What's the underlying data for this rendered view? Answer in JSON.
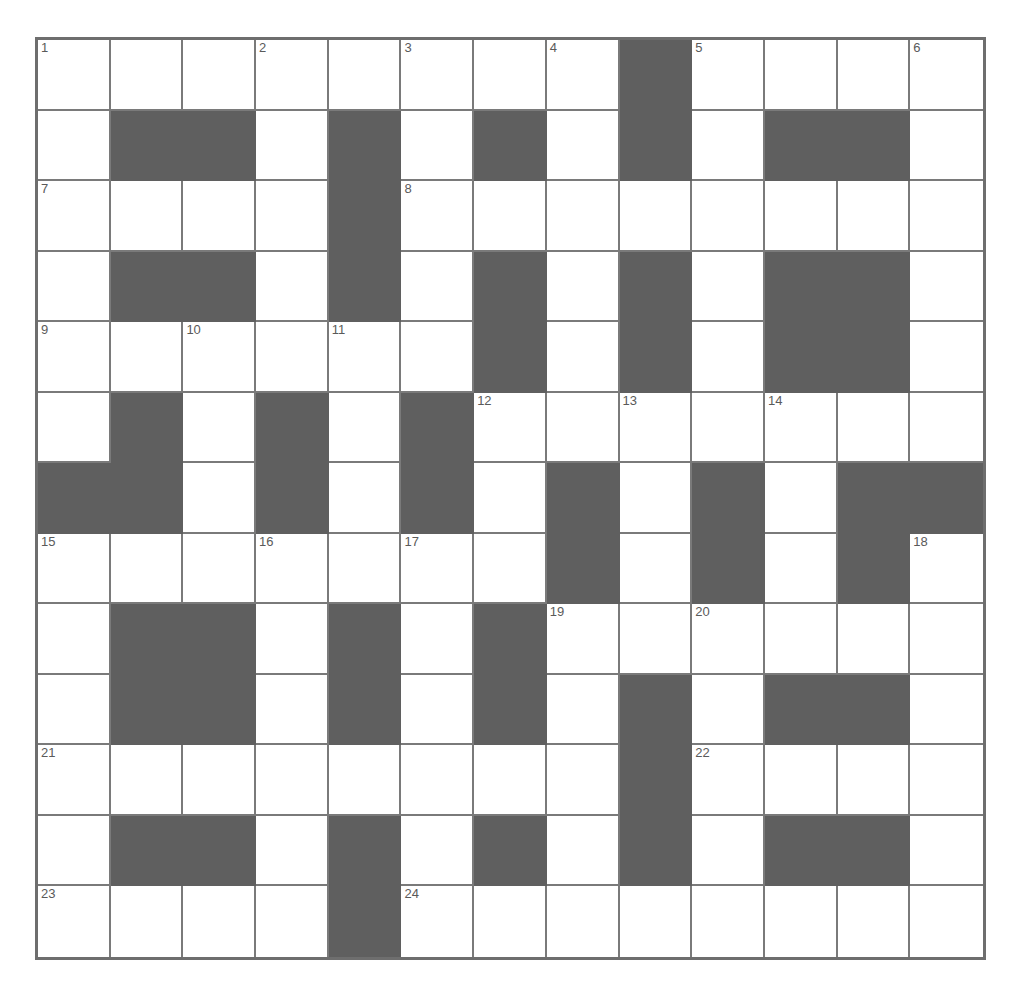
{
  "puzzle": {
    "rows": 13,
    "cols": 13,
    "colors": {
      "block": "#5f5f5f",
      "cell": "#ffffff",
      "grid_line": "#7a7a7a",
      "number": "#5a5a5a"
    },
    "grid": [
      "........#....",
      ".##.#.#.#.##.",
      "....#........",
      ".##.#.#.#.##.",
      "......#.#.##.",
      ".#.#.#.......",
      "##.#.#.#.#.##",
      ".......#.#.#.",
      ".##.#.#......",
      ".##.#.#.#.##.",
      "........#....",
      ".##.#.#.#.##.",
      "....#........"
    ],
    "numbers": [
      {
        "row": 0,
        "col": 0,
        "n": "1"
      },
      {
        "row": 0,
        "col": 3,
        "n": "2"
      },
      {
        "row": 0,
        "col": 5,
        "n": "3"
      },
      {
        "row": 0,
        "col": 7,
        "n": "4"
      },
      {
        "row": 0,
        "col": 9,
        "n": "5"
      },
      {
        "row": 0,
        "col": 12,
        "n": "6"
      },
      {
        "row": 2,
        "col": 0,
        "n": "7"
      },
      {
        "row": 2,
        "col": 5,
        "n": "8"
      },
      {
        "row": 4,
        "col": 0,
        "n": "9"
      },
      {
        "row": 4,
        "col": 2,
        "n": "10"
      },
      {
        "row": 4,
        "col": 4,
        "n": "11"
      },
      {
        "row": 5,
        "col": 6,
        "n": "12"
      },
      {
        "row": 5,
        "col": 8,
        "n": "13"
      },
      {
        "row": 5,
        "col": 10,
        "n": "14"
      },
      {
        "row": 7,
        "col": 0,
        "n": "15"
      },
      {
        "row": 7,
        "col": 3,
        "n": "16"
      },
      {
        "row": 7,
        "col": 5,
        "n": "17"
      },
      {
        "row": 7,
        "col": 12,
        "n": "18"
      },
      {
        "row": 8,
        "col": 7,
        "n": "19"
      },
      {
        "row": 8,
        "col": 9,
        "n": "20"
      },
      {
        "row": 10,
        "col": 0,
        "n": "21"
      },
      {
        "row": 10,
        "col": 9,
        "n": "22"
      },
      {
        "row": 12,
        "col": 0,
        "n": "23"
      },
      {
        "row": 12,
        "col": 5,
        "n": "24"
      }
    ],
    "entries": {}
  }
}
